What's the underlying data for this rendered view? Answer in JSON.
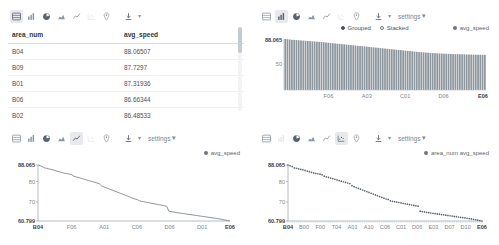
{
  "panels": {
    "table": {
      "toolbar": {
        "icons": [
          "table-icon",
          "bar-chart-icon",
          "pie-chart-icon",
          "area-chart-icon",
          "line-chart-icon",
          "scatter-chart-icon",
          "map-pin-icon"
        ],
        "download_icon": "download-icon",
        "caret": "▾",
        "settings_label": ""
      },
      "columns": [
        "area_num",
        "avg_speed"
      ],
      "rows": [
        {
          "area_num": "B04",
          "avg_speed": "88.06507"
        },
        {
          "area_num": "B09",
          "avg_speed": "87.7297"
        },
        {
          "area_num": "B01",
          "avg_speed": "87.31936"
        },
        {
          "area_num": "B06",
          "avg_speed": "86.66344"
        },
        {
          "area_num": "B02",
          "avg_speed": "86.48533"
        }
      ]
    },
    "bar": {
      "toolbar": {
        "settings_label": "settings",
        "caret": "▾"
      },
      "radios": [
        {
          "label": "Grouped",
          "selected": true
        },
        {
          "label": "Stacked",
          "selected": false
        }
      ],
      "legend": "avg_speed"
    },
    "line": {
      "toolbar": {
        "settings_label": "settings",
        "caret": "▾"
      },
      "legend": "avg_speed"
    },
    "scatter": {
      "toolbar": {
        "settings_label": "settings",
        "caret": "▾"
      },
      "legend": "area_num avg_speed"
    }
  },
  "chart_data": [
    {
      "id": "bar",
      "type": "bar",
      "title": "",
      "xlabel": "",
      "ylabel": "",
      "series_name": "avg_speed",
      "mode": "Grouped",
      "ylim": [
        0,
        88.065
      ],
      "yticks": [
        "88.065",
        "50"
      ],
      "xticks": [
        "F06",
        "A03",
        "C01",
        "D06",
        "E06"
      ],
      "xtick_positions": [
        0.22,
        0.41,
        0.6,
        0.79,
        0.985
      ],
      "grid": false,
      "legend_position": "top-right",
      "values": [
        88.07,
        87.73,
        87.32,
        86.66,
        86.49,
        86.2,
        85.9,
        85.6,
        85.3,
        85.0,
        84.7,
        84.4,
        84.1,
        83.8,
        83.5,
        83.2,
        82.9,
        82.5,
        82.0,
        81.6,
        81.2,
        80.8,
        80.4,
        80.0,
        79.6,
        79.2,
        78.8,
        78.4,
        78.0,
        77.6,
        77.2,
        76.8,
        76.4,
        76.0,
        75.6,
        75.2,
        74.8,
        74.4,
        74.0,
        73.6,
        73.2,
        72.8,
        72.4,
        72.0,
        71.6,
        71.2,
        70.8,
        70.4,
        70.0,
        69.6,
        69.2,
        68.8,
        68.4,
        68.0,
        67.6,
        67.2,
        66.8,
        66.4,
        66.0,
        65.6,
        65.2,
        64.9,
        64.6,
        64.3,
        64.0,
        63.8,
        63.6,
        63.4,
        63.2,
        63.0,
        62.8,
        62.6,
        62.4,
        62.2,
        62.0,
        61.9,
        61.8,
        61.7,
        61.6,
        61.5,
        61.4,
        61.3,
        61.2,
        61.1,
        61.0,
        60.95,
        60.9,
        60.85,
        60.8
      ]
    },
    {
      "id": "line",
      "type": "line",
      "title": "",
      "xlabel": "",
      "ylabel": "",
      "series_name": "avg_speed",
      "ylim": [
        60.799,
        88.065
      ],
      "yticks": [
        "88.065",
        "80",
        "70",
        "60.799"
      ],
      "ytick_values": [
        88.065,
        80,
        70,
        60.799
      ],
      "xticks": [
        "B04",
        "F06",
        "A01",
        "C06",
        "D06",
        "D01",
        "E06"
      ],
      "xtick_positions": [
        0.0,
        0.175,
        0.345,
        0.515,
        0.685,
        0.855,
        1.0
      ],
      "grid": false,
      "legend_position": "top-right",
      "values": [
        88.065,
        87.73,
        87.32,
        86.66,
        86.49,
        86.2,
        85.95,
        85.7,
        85.4,
        85.1,
        84.8,
        84.5,
        84.2,
        83.95,
        83.8,
        83.6,
        83.3,
        82.6,
        82.3,
        82.0,
        81.7,
        81.4,
        81.1,
        80.8,
        80.5,
        80.2,
        79.9,
        79.6,
        79.3,
        79.0,
        78.0,
        77.5,
        77.1,
        76.7,
        76.3,
        75.9,
        75.5,
        75.1,
        74.7,
        74.3,
        73.9,
        73.5,
        73.1,
        72.7,
        72.3,
        71.9,
        71.5,
        71.3,
        70.6,
        70.4,
        70.2,
        70.0,
        69.8,
        69.6,
        69.4,
        69.2,
        69.0,
        68.8,
        68.6,
        68.4,
        68.2,
        68.0,
        65.6,
        65.4,
        65.2,
        65.0,
        64.85,
        64.7,
        64.55,
        64.4,
        64.25,
        64.1,
        63.95,
        63.8,
        63.65,
        63.5,
        63.35,
        63.2,
        63.05,
        62.9,
        62.75,
        62.6,
        62.45,
        62.3,
        62.15,
        62.0,
        61.8,
        61.6,
        61.4,
        61.2,
        61.0,
        60.799
      ]
    },
    {
      "id": "scatter",
      "type": "scatter",
      "title": "",
      "xlabel": "",
      "ylabel": "",
      "series_name": "area_num avg_speed",
      "ylim": [
        60.799,
        88.065
      ],
      "yticks": [
        "88.065",
        "80",
        "70",
        "60.799"
      ],
      "ytick_values": [
        88.065,
        80,
        70,
        60.799
      ],
      "xticks": [
        "B04",
        "B00",
        "F00",
        "T04",
        "A01",
        "A10",
        "C06",
        "C01",
        "D06",
        "E03",
        "D07",
        "D10",
        "E06"
      ],
      "xtick_positions": [
        0.0,
        0.083,
        0.166,
        0.25,
        0.333,
        0.416,
        0.5,
        0.583,
        0.666,
        0.75,
        0.833,
        0.916,
        1.0
      ],
      "grid": false,
      "legend_position": "top-right",
      "values": [
        88.065,
        87.73,
        87.32,
        86.66,
        86.49,
        86.2,
        85.95,
        85.7,
        85.4,
        85.1,
        84.8,
        84.5,
        84.2,
        83.95,
        83.8,
        83.6,
        83.3,
        82.6,
        82.3,
        82.0,
        81.7,
        81.4,
        81.1,
        80.8,
        80.5,
        80.2,
        79.9,
        79.6,
        79.3,
        79.0,
        78.0,
        77.5,
        77.1,
        76.7,
        76.3,
        75.9,
        75.5,
        75.1,
        74.7,
        74.3,
        73.9,
        73.5,
        73.1,
        72.7,
        72.3,
        71.9,
        71.5,
        71.3,
        70.6,
        70.4,
        70.2,
        70.0,
        69.8,
        69.6,
        69.4,
        69.2,
        69.0,
        68.8,
        68.6,
        68.4,
        68.2,
        68.0,
        65.6,
        65.4,
        65.2,
        65.0,
        64.85,
        64.7,
        64.55,
        64.4,
        64.25,
        64.1,
        63.95,
        63.8,
        63.65,
        63.5,
        63.35,
        63.2,
        63.05,
        62.9,
        62.75,
        62.6,
        62.45,
        62.3,
        62.15,
        62.0,
        61.8,
        61.6,
        61.4,
        61.2,
        61.0,
        60.799
      ]
    }
  ]
}
